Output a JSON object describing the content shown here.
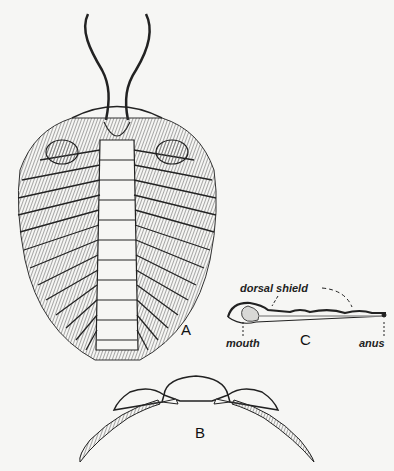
{
  "figure": {
    "panels": [
      {
        "id": "A",
        "label": "A",
        "description": "ventral view of trilobite with antennae and legs"
      },
      {
        "id": "B",
        "label": "B",
        "description": "cross-section of trilobite body with limbs"
      },
      {
        "id": "C",
        "label": "C",
        "description": "longitudinal section"
      }
    ],
    "annotations": {
      "dorsal_shield": "dorsal shield",
      "mouth": "mouth",
      "anus": "anus"
    },
    "colors": {
      "ink": "#222222",
      "shade": "#8a8a8a",
      "paper": "#f6f6f4",
      "fill": "#d8d8d6"
    }
  }
}
